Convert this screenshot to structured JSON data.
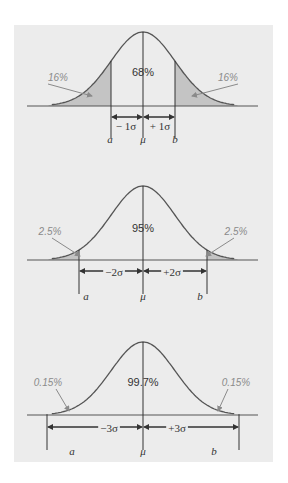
{
  "colors": {
    "background": "#ececec",
    "curve": "#555555",
    "tail_fill": "#c4c4c4",
    "tail_label": "#8a8a8a",
    "text": "#333333"
  },
  "panels": [
    {
      "k": 1,
      "center_label": "68%",
      "left_tail_label": "16%",
      "right_tail_label": "16%",
      "left_sigma_label": "− 1σ",
      "right_sigma_label": "+ 1σ",
      "left_bound_label": "a",
      "mean_label": "μ",
      "right_bound_label": "b"
    },
    {
      "k": 2,
      "center_label": "95%",
      "left_tail_label": "2.5%",
      "right_tail_label": "2.5%",
      "left_sigma_label": "−2σ",
      "right_sigma_label": "+2σ",
      "left_bound_label": "a",
      "mean_label": "μ",
      "right_bound_label": "b"
    },
    {
      "k": 3,
      "center_label": "99.7%",
      "left_tail_label": "0.15%",
      "right_tail_label": "0.15%",
      "left_sigma_label": "−3σ",
      "right_sigma_label": "+3σ",
      "left_bound_label": "a",
      "mean_label": "μ",
      "right_bound_label": "b"
    }
  ]
}
